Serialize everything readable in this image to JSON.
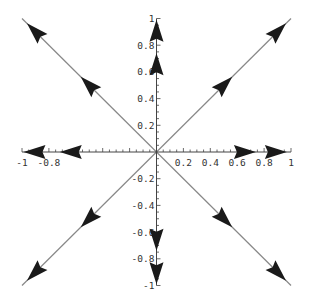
{
  "chart_data": {
    "type": "line",
    "title": "",
    "xlabel": "",
    "ylabel": "",
    "xlim": [
      -1,
      1
    ],
    "ylim": [
      -1,
      1
    ],
    "grid": false,
    "legend": null,
    "x_ticks": [
      "-1",
      "-0.8",
      "0.2",
      "0.4",
      "0.6",
      "0.8",
      "1"
    ],
    "y_ticks": [
      "1",
      "0.8",
      "0.6",
      "0.4",
      "0.2",
      "-0.2",
      "-0.4",
      "-0.6",
      "-0.8",
      "-1"
    ],
    "lines": [
      {
        "name": "diagonal-positive",
        "from": [
          -1,
          -1
        ],
        "to": [
          1,
          1
        ]
      },
      {
        "name": "diagonal-negative",
        "from": [
          -1,
          1
        ],
        "to": [
          1,
          -1
        ]
      }
    ],
    "arrows": [
      {
        "direction": "right",
        "positions": [
          [
            0.65,
            0
          ],
          [
            0.88,
            0
          ]
        ]
      },
      {
        "direction": "left",
        "positions": [
          [
            -0.63,
            0
          ],
          [
            -0.9,
            0
          ]
        ]
      },
      {
        "direction": "up",
        "positions": [
          [
            0,
            0.65
          ],
          [
            0,
            0.9
          ]
        ]
      },
      {
        "direction": "down",
        "positions": [
          [
            0,
            -0.65
          ],
          [
            0,
            -0.9
          ]
        ]
      },
      {
        "direction": "up-right",
        "positions": [
          [
            0.5,
            0.5
          ],
          [
            0.9,
            0.9
          ]
        ]
      },
      {
        "direction": "up-left",
        "positions": [
          [
            -0.5,
            0.5
          ],
          [
            -0.9,
            0.9
          ]
        ]
      },
      {
        "direction": "down-left",
        "positions": [
          [
            -0.5,
            -0.5
          ],
          [
            -0.9,
            -0.9
          ]
        ]
      },
      {
        "direction": "down-right",
        "positions": [
          [
            0.5,
            -0.5
          ],
          [
            0.9,
            -0.9
          ]
        ]
      }
    ]
  },
  "colors": {
    "axis": "#444444",
    "line": "#888888",
    "arrow": "#1a1a1a"
  }
}
